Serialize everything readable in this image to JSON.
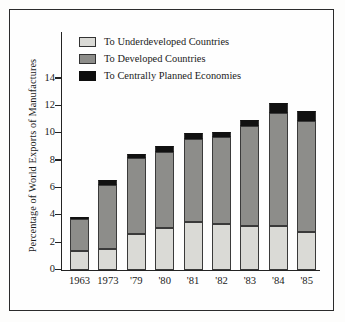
{
  "chart_data": {
    "type": "bar",
    "title": "",
    "subtitle": "",
    "stacked": true,
    "xlabel": "",
    "ylabel": "Percentage of World Exports of Manufactures",
    "ylim": [
      0,
      15
    ],
    "yticks": [
      0,
      2,
      4,
      6,
      8,
      10,
      12,
      14
    ],
    "ytick_labels": [
      "0",
      "2",
      "4",
      "6",
      "8",
      "10",
      "12",
      "14"
    ],
    "grid": false,
    "legend_position": "top-left",
    "categories": [
      "1963",
      "1973",
      "'79",
      "'80",
      "'81",
      "'82",
      "'83",
      "'84",
      "'85"
    ],
    "series": [
      {
        "name": "To Underdeveloped Countries",
        "color": "#dadad6",
        "values": [
          1.4,
          1.5,
          2.6,
          3.1,
          3.5,
          3.4,
          3.2,
          3.2,
          2.8
        ]
      },
      {
        "name": "To Developed Countries",
        "color": "#8d8d8a",
        "values": [
          2.3,
          4.7,
          5.6,
          5.5,
          6.1,
          6.3,
          7.3,
          8.3,
          8.1
        ]
      },
      {
        "name": "To Centrally Planned Economies",
        "color": "#0d0d0d",
        "values": [
          0.1,
          0.35,
          0.25,
          0.45,
          0.4,
          0.4,
          0.45,
          0.7,
          0.75
        ]
      }
    ],
    "totals": [
      3.8,
      6.55,
      8.45,
      9.05,
      10.0,
      10.1,
      10.95,
      12.2,
      11.65
    ]
  },
  "legend": {
    "items": [
      {
        "label": "To Underdeveloped Countries",
        "swatch": "light-gray-swatch"
      },
      {
        "label": "To Developed Countries",
        "swatch": "mid-gray-swatch"
      },
      {
        "label": "To Centrally Planned Economies",
        "swatch": "black-swatch"
      }
    ]
  },
  "axes": {
    "y_title": "Percentage of World Exports of Manufactures",
    "y_labels": [
      "14",
      "12",
      "10",
      "8",
      "6",
      "4",
      "2",
      "0"
    ],
    "x_labels": [
      "1963",
      "1973",
      "'79",
      "'80",
      "'81",
      "'82",
      "'83",
      "'84",
      "'85"
    ]
  },
  "colors": {
    "underdeveloped": "#dadad6",
    "developed": "#8d8d8a",
    "centrally_planned": "#0d0d0d",
    "axis": "#232323",
    "frame": "#2b2b2b",
    "background": "#fefefe"
  }
}
